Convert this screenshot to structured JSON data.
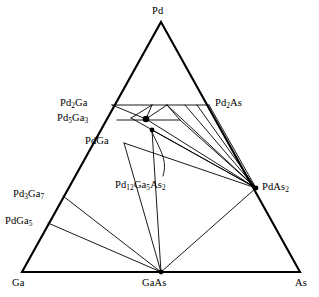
{
  "figure": {
    "type": "ternary-phase-diagram",
    "system": "Pd-Ga-As",
    "background_color": "#ffffff",
    "line_color": "#000000"
  },
  "vertices": {
    "top": {
      "label_html": "Pd",
      "name": "Pd"
    },
    "bottom_left": {
      "label_html": "Ga",
      "name": "Ga"
    },
    "bottom_right": {
      "label_html": "As",
      "name": "As"
    }
  },
  "binary_compounds": {
    "pd_ga_side": [
      {
        "id": "pd2ga",
        "label_html": "Pd<sub>2</sub>Ga"
      },
      {
        "id": "pd5ga3",
        "label_html": "Pd<sub>5</sub>Ga<sub>3</sub>"
      },
      {
        "id": "pdga",
        "label_html": "PdGa"
      },
      {
        "id": "pd3ga7",
        "label_html": "Pd<sub>3</sub>Ga<sub>7</sub>"
      },
      {
        "id": "pdga5",
        "label_html": "PdGa<sub>5</sub>"
      }
    ],
    "pd_as_side": [
      {
        "id": "pd2as",
        "label_html": "Pd<sub>2</sub>As"
      },
      {
        "id": "pdas2",
        "label_html": "PdAs<sub>2</sub>"
      }
    ],
    "ga_as_side": [
      {
        "id": "gaas",
        "label_html": "GaAs"
      }
    ]
  },
  "ternary_compounds": [
    {
      "id": "pd12ga5as2",
      "label_html": "Pd<sub>12</sub>Ga<sub>5</sub>As<sub>2</sub>",
      "marker": "filled-circle",
      "count": 2
    }
  ],
  "labels": {
    "pd": "Pd",
    "ga": "Ga",
    "as": "As",
    "gaas": "GaAs",
    "pd2ga": "Pd2Ga",
    "pd5ga3": "Pd5Ga3",
    "pdga": "PdGa",
    "pd3ga7": "Pd3Ga7",
    "pdga5": "PdGa5",
    "pd2as": "Pd2As",
    "pdas2": "PdAs2",
    "pd12ga5as2": "Pd12Ga5As2"
  },
  "geometry": {
    "triangle": {
      "apex": [
        161,
        22
      ],
      "left": [
        22,
        272
      ],
      "right": [
        300,
        272
      ]
    },
    "nodes": {
      "pd2ga": [
        112,
        105
      ],
      "pd5ga3": [
        117,
        120
      ],
      "pdga": [
        124,
        143
      ],
      "pd3ga7": [
        63,
        196
      ],
      "pdga5": [
        48,
        223
      ],
      "pd2as": [
        209,
        105
      ],
      "pdas2": [
        256,
        188
      ],
      "gaas": [
        161,
        272
      ],
      "ternary_a": [
        146,
        119
      ],
      "ternary_b": [
        152,
        130
      ]
    }
  },
  "chart_data": {
    "type": "diagram",
    "tie_lines": [
      [
        "pd2ga",
        "pd2as"
      ],
      [
        "pd2ga",
        "ternary_a"
      ],
      [
        "pd5ga3",
        "ternary_a"
      ],
      [
        "ternary_a",
        "pd2as"
      ],
      [
        "pd5ga3",
        "pdas2"
      ],
      [
        "pdga",
        "pdas2"
      ],
      [
        "pd2ga",
        "pdas2"
      ],
      [
        "ternary_a",
        "pdas2"
      ],
      [
        "ternary_b",
        "pdas2"
      ],
      [
        "pdga",
        "gaas"
      ],
      [
        "pd3ga7",
        "gaas"
      ],
      [
        "pdga5",
        "gaas"
      ],
      [
        "gaas",
        "pdas2"
      ],
      [
        "ternary_b",
        "gaas"
      ]
    ]
  }
}
